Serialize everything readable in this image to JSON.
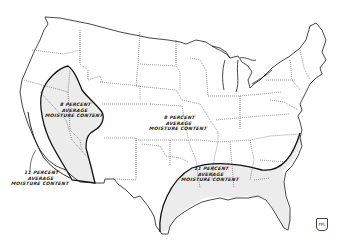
{
  "map": {
    "subject": "Conterminous United States outline map with state boundaries",
    "colors": {
      "background": "#ffffff",
      "outline": "#1a1a1a",
      "state_borders": "#333333",
      "zone_fill": "#ececec",
      "zone_border": "#111111"
    },
    "zones": [
      {
        "id": "west-interior",
        "label_lines": [
          "8 PERCENT",
          "AVERAGE",
          "MOISTURE CONTENT"
        ],
        "region": "Great Basin / Intermountain West (shaded)"
      },
      {
        "id": "central",
        "label_lines": [
          "8 PERCENT",
          "AVERAGE",
          "MOISTURE CONTENT"
        ],
        "region": "Central and Northern US (unshaded)"
      },
      {
        "id": "pacific-coast",
        "label_lines": [
          "11 PERCENT",
          "AVERAGE",
          "MOISTURE CONTENT"
        ],
        "region": "Pacific coastal strip"
      },
      {
        "id": "gulf-southeast",
        "label_lines": [
          "11 PERCENT",
          "AVERAGE",
          "MOISTURE CONTENT"
        ],
        "region": "Gulf coast and Southeast (shaded)"
      }
    ],
    "logo_text": "FPL"
  }
}
